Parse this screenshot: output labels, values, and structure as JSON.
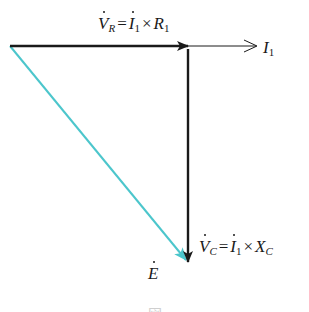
{
  "diagram": {
    "type": "phasor-diagram",
    "colors": {
      "vector_black": "#1a1a1a",
      "vector_cyan": "#4cc6cc"
    },
    "vectors": [
      {
        "id": "VR",
        "name": "resistor-voltage",
        "from": "origin",
        "direction": "right",
        "color": "black"
      },
      {
        "id": "I1",
        "name": "current-reference",
        "direction": "right",
        "style": "thin-open-arrow",
        "color": "black"
      },
      {
        "id": "VC",
        "name": "capacitor-voltage",
        "from": "tip of VR",
        "direction": "down",
        "color": "black"
      },
      {
        "id": "E",
        "name": "source-voltage",
        "from": "origin",
        "to": "tip of VC",
        "color": "cyan"
      }
    ],
    "labels": {
      "vr": {
        "lhs": "V",
        "lhs_sub": "R",
        "eq": "=",
        "i": "I",
        "i_sub": "1",
        "times": "×",
        "r": "R",
        "r_sub": "1"
      },
      "i1": {
        "sym": "I",
        "sub": "1"
      },
      "vc": {
        "lhs": "V",
        "lhs_sub": "C",
        "eq": "=",
        "i": "I",
        "i_sub": "1",
        "times": "×",
        "x": "X",
        "x_sub": "C"
      },
      "e": {
        "sym": "E"
      }
    },
    "caption": "図"
  }
}
